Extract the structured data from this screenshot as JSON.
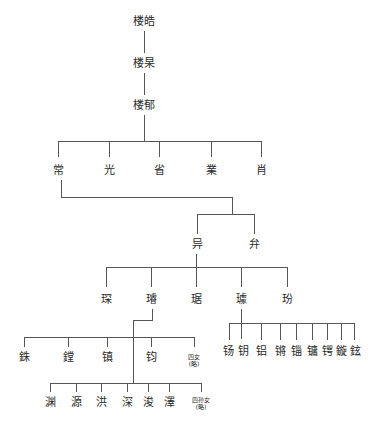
{
  "tree": {
    "gen1": "楼皓",
    "gen2": "楼杲",
    "gen3": "楼郁",
    "gen4": [
      "常",
      "光",
      "省",
      "業",
      "肖"
    ],
    "gen5": [
      "异",
      "弁"
    ],
    "gen6": [
      "琛",
      "璿",
      "琚",
      "璩",
      "玢"
    ],
    "gen7_left": [
      "銖",
      "鏜",
      "镇",
      "钧"
    ],
    "gen7_left_note": {
      "line1": "四女",
      "line2": "(略)"
    },
    "gen7_right": [
      "钖",
      "钥",
      "铝",
      "锵",
      "锱",
      "镛",
      "锷",
      "鏇",
      "鉉"
    ],
    "gen8": [
      "渊",
      "源",
      "洪",
      "深",
      "浚",
      "澤"
    ],
    "gen8_note": {
      "line1": "四孙女",
      "line2": "(略)"
    }
  }
}
